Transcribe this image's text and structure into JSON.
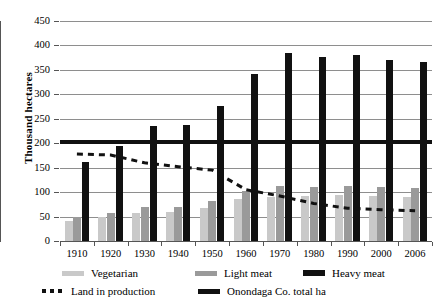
{
  "chart_data": {
    "type": "bar",
    "title": "",
    "xlabel": "",
    "ylabel": "Thousand hectares",
    "ylim": [
      0,
      450
    ],
    "ytick_step": 50,
    "grid": true,
    "legend_position": "bottom",
    "categories": [
      "1910",
      "1920",
      "1930",
      "1940",
      "1950",
      "1960",
      "1970",
      "1980",
      "1990",
      "2000",
      "2006"
    ],
    "yticks": [
      "0",
      "50",
      "100",
      "150",
      "200",
      "250",
      "300",
      "350",
      "400",
      "450"
    ],
    "series": [
      {
        "name": "Vegetarian",
        "kind": "bar",
        "color": "#c9c9c9",
        "values": [
          40,
          49,
          58,
          59,
          67,
          85,
          90,
          92,
          94,
          92,
          91
        ]
      },
      {
        "name": "Light meat",
        "kind": "bar",
        "color": "#9a9a9a",
        "values": [
          49,
          57,
          69,
          70,
          82,
          103,
          113,
          110,
          112,
          110,
          109
        ]
      },
      {
        "name": "Heavy meat",
        "kind": "bar",
        "color": "#111111",
        "values": [
          161,
          194,
          235,
          237,
          277,
          342,
          384,
          376,
          380,
          371,
          367
        ]
      },
      {
        "name": "Land in production",
        "kind": "dashed-line",
        "color": "#111111",
        "values": [
          178,
          176,
          160,
          152,
          145,
          105,
          92,
          77,
          67,
          64,
          62
        ]
      },
      {
        "name": "Onondaga Co. total ha",
        "kind": "reference-line",
        "color": "#111111",
        "value": 202
      }
    ]
  },
  "legend": {
    "items": [
      {
        "label": "Vegetarian",
        "swatch": "veg"
      },
      {
        "label": "Light meat",
        "swatch": "light"
      },
      {
        "label": "Heavy meat",
        "swatch": "heavy"
      },
      {
        "label": "Land in production",
        "swatch": "dashed"
      },
      {
        "label": "Onondaga Co. total ha",
        "swatch": "total"
      }
    ]
  }
}
